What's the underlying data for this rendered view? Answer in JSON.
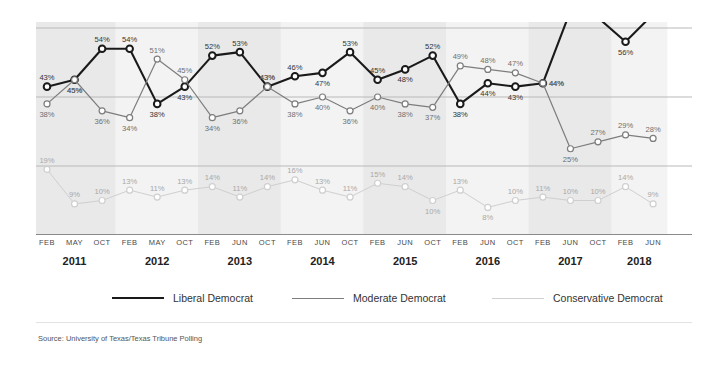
{
  "source": {
    "text": "Source: University of Texas/Texas Tribune Polling"
  },
  "legend": {
    "items": [
      {
        "label": "Liberal Democrat",
        "color": "#1a1a1a"
      },
      {
        "label": "Moderate Democrat",
        "color": "#7d7d7d"
      },
      {
        "label": "Conservative Democrat",
        "color": "#cfcfcf"
      }
    ]
  },
  "axis": {
    "months": [
      "FEB",
      "MAY",
      "OCT",
      "FEB",
      "MAY",
      "OCT",
      "FEB",
      "JUN",
      "OCT",
      "FEB",
      "JUN",
      "OCT",
      "FEB",
      "JUN",
      "OCT",
      "FEB",
      "JUN",
      "OCT",
      "FEB",
      "JUN",
      "OCT",
      "FEB",
      "JUN"
    ],
    "years": [
      "2011",
      "2012",
      "2013",
      "2014",
      "2015",
      "2016",
      "2017",
      "2018"
    ]
  },
  "chart_data": {
    "type": "line",
    "title": "",
    "xlabel": "",
    "ylabel": "",
    "ylim": [
      0,
      70
    ],
    "grid": true,
    "legend_position": "bottom",
    "gridlines": [
      20,
      40,
      60
    ],
    "x": [
      "FEB 2011",
      "MAY 2011",
      "OCT 2011",
      "FEB 2012",
      "MAY 2012",
      "OCT 2012",
      "FEB 2013",
      "JUN 2013",
      "OCT 2013",
      "FEB 2014",
      "JUN 2014",
      "OCT 2014",
      "FEB 2015",
      "JUN 2015",
      "OCT 2015",
      "FEB 2016",
      "JUN 2016",
      "OCT 2016",
      "FEB 2017",
      "JUN 2017",
      "OCT 2017",
      "FEB 2018",
      "JUN 2018"
    ],
    "categories": [
      "FEB 2011",
      "MAY 2011",
      "OCT 2011",
      "FEB 2012",
      "MAY 2012",
      "OCT 2012",
      "FEB 2013",
      "JUN 2013",
      "OCT 2013",
      "FEB 2014",
      "JUN 2014",
      "OCT 2014",
      "FEB 2015",
      "JUN 2015",
      "OCT 2015",
      "FEB 2016",
      "JUN 2016",
      "OCT 2016",
      "FEB 2017",
      "JUN 2017",
      "OCT 2017",
      "FEB 2018",
      "JUN 2018"
    ],
    "series": [
      {
        "name": "Liberal Democrat",
        "color": "#1a1a1a",
        "values": [
          43,
          45,
          54,
          54,
          38,
          43,
          52,
          53,
          43,
          46,
          47,
          53,
          45,
          48,
          52,
          38,
          44,
          43,
          44,
          65,
          63,
          56,
          64
        ],
        "labels": [
          "43%",
          "45%",
          "54%",
          "54%",
          "38%",
          "43%",
          "52%",
          "53%",
          "43%",
          "46%",
          "47%",
          "53%",
          "45%",
          "48%",
          "52%",
          "38%",
          "44%",
          "43%",
          "44%",
          "65%",
          "63%",
          "56%",
          "64%"
        ],
        "label_pos": [
          "above",
          "below",
          "above",
          "above",
          "below",
          "below",
          "above",
          "above",
          "above",
          "above",
          "below",
          "above",
          "above",
          "below",
          "above",
          "below",
          "below",
          "below",
          "right",
          "above",
          "above",
          "below",
          "above"
        ]
      },
      {
        "name": "Moderate Democrat",
        "color": "#7d7d7d",
        "values": [
          38,
          45,
          36,
          34,
          51,
          45,
          34,
          36,
          43,
          38,
          40,
          36,
          40,
          38,
          37,
          49,
          48,
          47,
          44,
          25,
          27,
          29,
          28
        ],
        "labels": [
          "38%",
          "45%",
          "36%",
          "34%",
          "51%",
          "45%",
          "34%",
          "36%",
          "43%",
          "38%",
          "40%",
          "36%",
          "40%",
          "38%",
          "37%",
          "49%",
          "48%",
          "47%",
          "44%",
          "25%",
          "27%",
          "29%",
          "28%"
        ],
        "label_pos": [
          "below",
          "below",
          "below",
          "below",
          "above",
          "above",
          "below",
          "below",
          "above",
          "below",
          "below",
          "below",
          "below",
          "below",
          "below",
          "above",
          "above",
          "above",
          "right",
          "below",
          "above",
          "above",
          "above"
        ]
      },
      {
        "name": "Conservative Democrat",
        "color": "#cfcfcf",
        "values": [
          19,
          9,
          10,
          13,
          11,
          13,
          14,
          11,
          14,
          16,
          13,
          11,
          15,
          14,
          10,
          13,
          8,
          10,
          11,
          10,
          10,
          14,
          9
        ],
        "labels": [
          "19%",
          "9%",
          "10%",
          "13%",
          "11%",
          "13%",
          "14%",
          "11%",
          "14%",
          "16%",
          "13%",
          "11%",
          "15%",
          "14%",
          "10%",
          "13%",
          "8%",
          "10%",
          "11%",
          "10%",
          "10%",
          "14%",
          "9%"
        ],
        "label_pos": [
          "above",
          "above",
          "above",
          "above",
          "above",
          "above",
          "above",
          "above",
          "above",
          "above",
          "above",
          "above",
          "above",
          "above",
          "below",
          "above",
          "below",
          "above",
          "above",
          "above",
          "above",
          "above",
          "above"
        ]
      }
    ]
  }
}
